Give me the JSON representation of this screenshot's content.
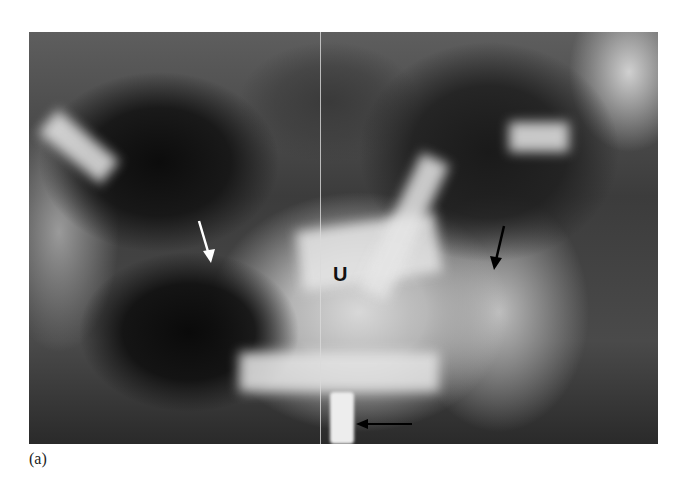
{
  "figure": {
    "type": "radiograph",
    "panel_label": "(a)",
    "annotations": [
      {
        "label": "U",
        "kind": "text-label"
      },
      {
        "label": "white-arrow",
        "kind": "arrow",
        "color": "#ffffff",
        "direction": "down-right"
      },
      {
        "label": "black-arrow",
        "kind": "arrow",
        "color": "#000000",
        "direction": "down-left"
      },
      {
        "label": "black-horizontal-arrow",
        "kind": "arrow",
        "color": "#000000",
        "direction": "left"
      }
    ]
  }
}
